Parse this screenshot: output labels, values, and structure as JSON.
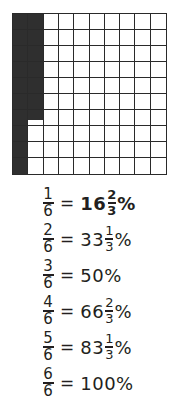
{
  "grid": {
    "rows": 10,
    "columns": 10,
    "shaded_full_cells": 16,
    "shaded_partial_fraction": "2/3",
    "shaded_color": "#2f2f2f",
    "line_color": "#2a2a2a",
    "description": "10x10 hundred grid with 16 2/3 squares shaded: full first column, 6 squares of second column, and 2/3 of the 7th square"
  },
  "equations": [
    {
      "numerator": "1",
      "denominator": "6",
      "equals": "=",
      "whole": "16",
      "frac_num": "2",
      "frac_den": "3",
      "percent": "%",
      "bold": true
    },
    {
      "numerator": "2",
      "denominator": "6",
      "equals": "=",
      "whole": "33",
      "frac_num": "1",
      "frac_den": "3",
      "percent": "%",
      "bold": false
    },
    {
      "numerator": "3",
      "denominator": "6",
      "equals": "=",
      "whole": "50",
      "frac_num": "",
      "frac_den": "",
      "percent": "%",
      "bold": false
    },
    {
      "numerator": "4",
      "denominator": "6",
      "equals": "=",
      "whole": "66",
      "frac_num": "2",
      "frac_den": "3",
      "percent": "%",
      "bold": false
    },
    {
      "numerator": "5",
      "denominator": "6",
      "equals": "=",
      "whole": "83",
      "frac_num": "1",
      "frac_den": "3",
      "percent": "%",
      "bold": false
    },
    {
      "numerator": "6",
      "denominator": "6",
      "equals": "=",
      "whole": "100",
      "frac_num": "",
      "frac_den": "",
      "percent": "%",
      "bold": false
    }
  ]
}
